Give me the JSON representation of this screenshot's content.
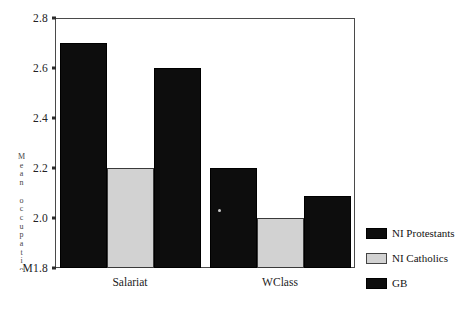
{
  "chart_data": {
    "type": "bar",
    "title": "",
    "subtitle": "",
    "xlabel": "",
    "ylabel": "Mean occupational status score",
    "ylabel_note": "rotated vertical axis title, degraded/illegible in scan",
    "categories": [
      "Salariat",
      "WClass"
    ],
    "series": [
      {
        "name": "NI Protestants",
        "color": "#0d0d0d",
        "values": [
          2.7,
          2.2
        ]
      },
      {
        "name": "NI Catholics",
        "color": "#d2d2d2",
        "values": [
          2.2,
          2.0
        ]
      },
      {
        "name": "GB",
        "color": "#0d0d0d",
        "values": [
          2.6,
          2.09
        ]
      }
    ],
    "ylim": [
      1.8,
      2.8
    ],
    "ytick_values": [
      2.8,
      2.6,
      2.4,
      2.2,
      2.0,
      1.8
    ],
    "ytick_labels": [
      "2.8",
      "2.6",
      "2.4",
      "2.2",
      "2.0",
      "M1.8"
    ],
    "grid": false,
    "legend_position": "right",
    "bar_gap_within_group": 0,
    "frame": true
  },
  "axis": {
    "y_title": "Mean occupational status score"
  },
  "legend": {
    "items": [
      {
        "label": "NI Protestants",
        "swatch": "dark"
      },
      {
        "label": "NI Catholics",
        "swatch": "light"
      },
      {
        "label": "GB",
        "swatch": "dark"
      }
    ]
  }
}
